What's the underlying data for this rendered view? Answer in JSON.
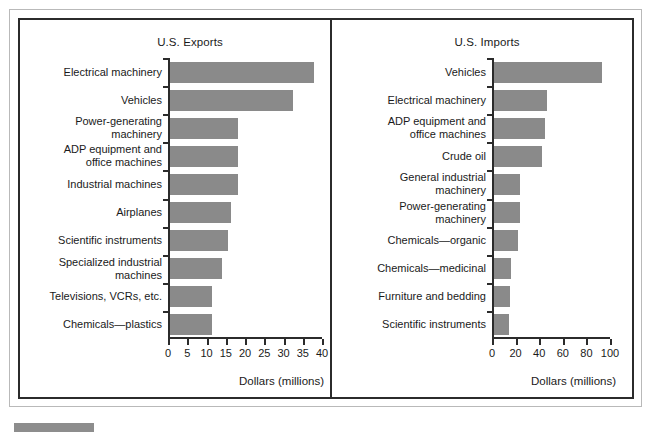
{
  "figure": {
    "bar_color": "#8a8a8a",
    "frame_color": "#2b2b2b",
    "outer_frame_color": "#b9b9b9"
  },
  "chart_data": [
    {
      "type": "bar",
      "orientation": "horizontal",
      "title": "U.S. Exports",
      "xlabel": "Dollars (millions)",
      "ylabel": "",
      "xlim": [
        0,
        40
      ],
      "xticks": [
        0,
        5,
        10,
        15,
        20,
        25,
        30,
        35,
        40
      ],
      "xticklabels": [
        "0",
        "5",
        "10",
        "15",
        "20",
        "25",
        "30",
        "35",
        "40"
      ],
      "grid": false,
      "legend": false,
      "categories": [
        "Electrical machinery",
        "Vehicles",
        "Power-generating\nmachinery",
        "ADP equipment and\noffice machines",
        "Industrial machines",
        "Airplanes",
        "Scientific instruments",
        "Specialized industrial\nmachines",
        "Televisions, VCRs, etc.",
        "Chemicals—plastics"
      ],
      "values": [
        38,
        32.5,
        18.2,
        18.2,
        18.2,
        16.4,
        15.5,
        14,
        11.5,
        11.5
      ]
    },
    {
      "type": "bar",
      "orientation": "horizontal",
      "title": "U.S. Imports",
      "xlabel": "Dollars (millions)",
      "ylabel": "",
      "xlim": [
        0,
        100
      ],
      "xticks": [
        0,
        20,
        40,
        60,
        80,
        100
      ],
      "xticklabels": [
        "0",
        "20",
        "40",
        "60",
        "80",
        "100"
      ],
      "grid": false,
      "legend": false,
      "categories": [
        "Vehicles",
        "Electrical machinery",
        "ADP equipment and\noffice machines",
        "Crude oil",
        "General industrial\nmachinery",
        "Power-generating\nmachinery",
        "Chemicals—organic",
        "Chemicals—medicinal",
        "Furniture and bedding",
        "Scientific instruments"
      ],
      "values": [
        93,
        47,
        45,
        42,
        24,
        24,
        22,
        16,
        15,
        14
      ]
    }
  ]
}
